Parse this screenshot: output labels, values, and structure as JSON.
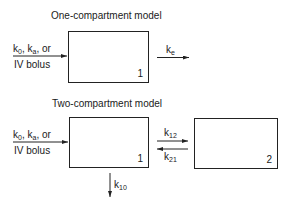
{
  "one_compartment": {
    "title": "One-compartment model",
    "input_label_line1_parts": [
      "k",
      "0",
      ", k",
      "a",
      ", or"
    ],
    "input_label_line2": "IV bolus",
    "compartment_number": "1",
    "elimination_label": {
      "base": "k",
      "sub": "e"
    }
  },
  "two_compartment": {
    "title": "Two-compartment model",
    "input_label_line1_parts": [
      "k",
      "0",
      ", k",
      "a",
      ", or"
    ],
    "input_label_line2": "IV bolus",
    "central_compartment_number": "1",
    "peripheral_compartment_number": "2",
    "k12_label": {
      "base": "k",
      "sub": "12"
    },
    "k21_label": {
      "base": "k",
      "sub": "21"
    },
    "k10_label": {
      "base": "k",
      "sub": "10"
    }
  },
  "colors": {
    "line": "#222222",
    "text": "#1a1a1a",
    "background": "#ffffff"
  }
}
